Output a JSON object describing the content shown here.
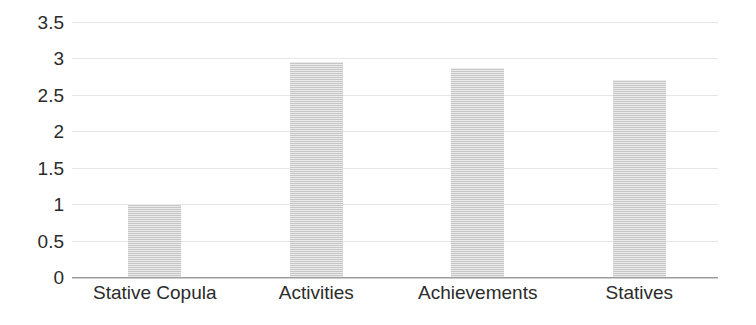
{
  "chart_data": {
    "type": "bar",
    "title": "",
    "subtitle": "",
    "xlabel": "",
    "ylabel": "",
    "categories": [
      "Stative Copula",
      "Activities",
      "Achievements",
      "Statives"
    ],
    "values": [
      1.0,
      2.95,
      2.87,
      2.71
    ],
    "series": [
      {
        "name": "",
        "values": [
          1.0,
          2.95,
          2.87,
          2.71
        ]
      }
    ],
    "ylim": [
      0,
      3.5
    ],
    "ytick_values": [
      0,
      0.5,
      1,
      1.5,
      2,
      2.5,
      3,
      3.5
    ],
    "ytick_labels": [
      "0",
      "0.5",
      "1",
      "1.5",
      "2",
      "2.5",
      "3",
      "3.5"
    ],
    "grid": true,
    "grid_axis": "y",
    "legend": false,
    "legend_position": "none",
    "bar_color": "#d2d2d2",
    "gridline_color": "#e6e6e6",
    "axis_color": "#9b9b9b",
    "text_color": "#2b2b2b",
    "background_color": "#ffffff",
    "annotations": []
  }
}
